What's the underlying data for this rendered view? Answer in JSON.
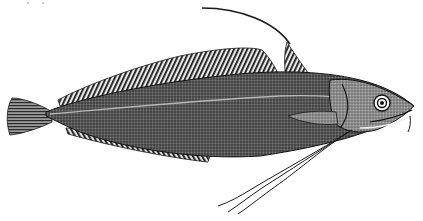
{
  "image": {
    "subject": "Engraved illustration of a fish (hake-like) with a long trailing pelvic filament",
    "style": "black-and-white stippled engraving",
    "colors": {
      "background": "#ffffff",
      "ink": "#1a1a1a",
      "body_tone": "#4a4a4a",
      "light_tone": "#9a9a9a"
    },
    "parts": [
      "caudal-fin",
      "dorsal-fin",
      "first-dorsal-fin",
      "anal-fin",
      "pectoral-fin",
      "head",
      "eye",
      "pelvic-filament",
      "barbel"
    ]
  }
}
